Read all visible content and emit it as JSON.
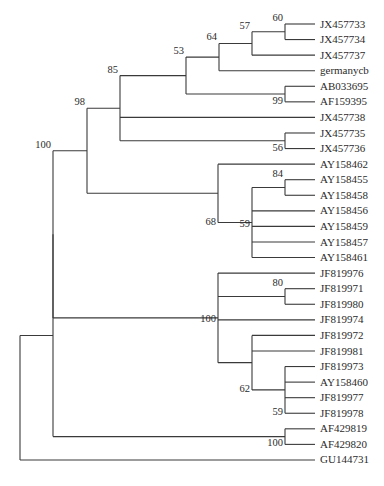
{
  "tree": {
    "type": "phylogenetic-tree",
    "layout": {
      "leaf_x_end": 315,
      "label_x": 320,
      "first_leaf_y": 24,
      "leaf_spacing": 15.57
    },
    "leaves": [
      "JX457733",
      "JX457734",
      "JX457737",
      "germanycb",
      "AB033695",
      "AF159395",
      "JX457738",
      "JX457735",
      "JX457736",
      "AY158462",
      "AY158455",
      "AY158458",
      "AY158456",
      "AY158459",
      "AY158457",
      "AY158461",
      "JF819976",
      "JF819971",
      "JF819980",
      "JF819974",
      "JF819972",
      "JF819981",
      "JF819973",
      "AY158460",
      "JF819977",
      "JF819978",
      "AF429819",
      "AF429820",
      "GU144731"
    ],
    "nodes": [
      {
        "id": "n60",
        "x": 285,
        "children": [
          "L0",
          "L1"
        ],
        "support": "60",
        "label_pos": "above"
      },
      {
        "id": "n57",
        "x": 252,
        "children": [
          "n60",
          "L2"
        ],
        "support": "57",
        "label_pos": "above"
      },
      {
        "id": "n64",
        "x": 219,
        "children": [
          "n57",
          "L3"
        ],
        "support": "64",
        "label_pos": "above"
      },
      {
        "id": "n99",
        "x": 285,
        "children": [
          "L4",
          "L5"
        ],
        "support": "99",
        "label_pos": "below"
      },
      {
        "id": "n53",
        "x": 186,
        "children": [
          "n64",
          "n99"
        ],
        "support": "53",
        "label_pos": "above"
      },
      {
        "id": "n56",
        "x": 285,
        "children": [
          "L7",
          "L8"
        ],
        "support": "56",
        "label_pos": "below"
      },
      {
        "id": "n85",
        "x": 120,
        "children": [
          "n53",
          "L6",
          "n56"
        ],
        "support": "85",
        "label_pos": "above"
      },
      {
        "id": "n84",
        "x": 285,
        "children": [
          "L10",
          "L11"
        ],
        "support": "84",
        "label_pos": "above"
      },
      {
        "id": "n59a",
        "x": 252,
        "children": [
          "n84",
          "L12",
          "L13",
          "L14",
          "L15"
        ],
        "support": "59",
        "label_pos": "mid"
      },
      {
        "id": "n68",
        "x": 218,
        "children": [
          "L9",
          "n59a"
        ],
        "support": "68",
        "label_pos": "below"
      },
      {
        "id": "n98",
        "x": 87,
        "children": [
          "n85",
          "n68"
        ],
        "support": "98",
        "label_pos": "above"
      },
      {
        "id": "n80",
        "x": 285,
        "children": [
          "L17",
          "L18"
        ],
        "support": "80",
        "label_pos": "above"
      },
      {
        "id": "n59b",
        "x": 285,
        "children": [
          "L22",
          "L23",
          "L24",
          "L25"
        ],
        "support": "59",
        "label_pos": "below"
      },
      {
        "id": "n62",
        "x": 252,
        "children": [
          "L20",
          "L21",
          "n59b"
        ],
        "support": "62",
        "label_pos": "below"
      },
      {
        "id": "n100a",
        "x": 218,
        "children": [
          "L16",
          "n80",
          "L19",
          "n62"
        ],
        "support": "100",
        "label_pos": "mid"
      },
      {
        "id": "n100b",
        "x": 53,
        "children": [
          "n98",
          "n100a"
        ],
        "support": "100",
        "label_pos": "above"
      },
      {
        "id": "n100c",
        "x": 285,
        "children": [
          "L26",
          "L27"
        ],
        "support": "100",
        "label_pos": "below"
      },
      {
        "id": "n100d",
        "x": 53,
        "children": [
          "n100b",
          "n100c"
        ],
        "support": "",
        "label_pos": "none"
      },
      {
        "id": "root",
        "x": 20,
        "children": [
          "n100d",
          "L28"
        ],
        "support": "",
        "label_pos": "none"
      }
    ]
  }
}
